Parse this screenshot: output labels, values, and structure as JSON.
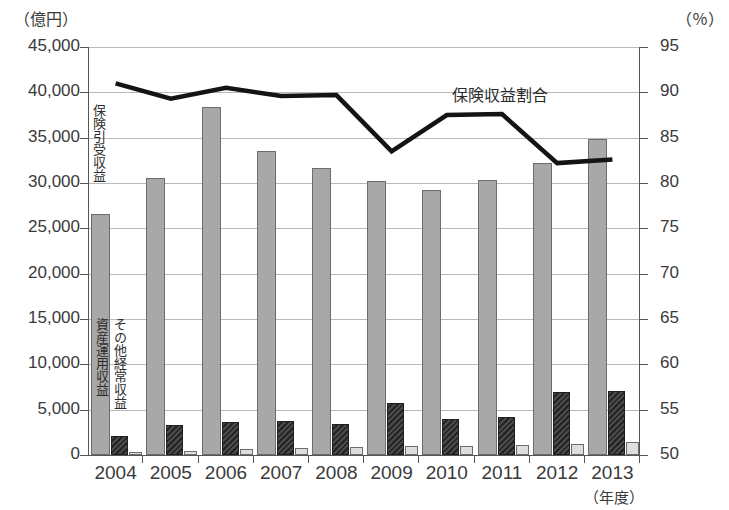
{
  "chart_data": {
    "type": "bar",
    "title": "",
    "xlabel": "年度",
    "ylabel": "億円",
    "y2label": "%",
    "ylim": [
      0,
      45000
    ],
    "y2lim": [
      50,
      95
    ],
    "grid": true,
    "legend_position": "inline-annotations",
    "categories": [
      "2004",
      "2005",
      "2006",
      "2007",
      "2008",
      "2009",
      "2010",
      "2011",
      "2012",
      "2013"
    ],
    "series": [
      {
        "name": "保険引受収益",
        "type": "bar",
        "axis": "left",
        "unit": "億円",
        "color": "#a8a8a8",
        "values": [
          26600,
          30600,
          38400,
          33500,
          31700,
          30200,
          29200,
          30300,
          32200,
          34800
        ]
      },
      {
        "name": "資産運用収益",
        "type": "bar",
        "axis": "left",
        "unit": "億円",
        "color": "#3a3a3a",
        "values": [
          2100,
          3300,
          3600,
          3750,
          3400,
          5700,
          4000,
          4200,
          6900,
          7100
        ]
      },
      {
        "name": "その他経常収益",
        "type": "bar",
        "axis": "left",
        "unit": "億円",
        "color": "#dedede",
        "values": [
          350,
          450,
          700,
          750,
          900,
          1000,
          1000,
          1100,
          1200,
          1450
        ]
      },
      {
        "name": "保険収益割合",
        "type": "line",
        "axis": "right",
        "unit": "%",
        "color": "#1a1a1a",
        "values": [
          91.0,
          89.3,
          90.5,
          89.6,
          89.7,
          83.5,
          87.5,
          87.6,
          82.2,
          82.6
        ]
      }
    ],
    "y_ticks": [
      "0",
      "5,000",
      "10,000",
      "15,000",
      "20,000",
      "25,000",
      "30,000",
      "35,000",
      "40,000",
      "45,000"
    ],
    "y2_ticks": [
      "50",
      "55",
      "60",
      "65",
      "70",
      "75",
      "80",
      "85",
      "90",
      "95"
    ]
  },
  "labels": {
    "unit_left": "（億円）",
    "unit_right": "（％）",
    "x_unit": "（年度）",
    "annotation_line": "保険収益割合",
    "annotation_bar_insurance": "保険引受収益",
    "annotation_bar_asset": "資産運用収益",
    "annotation_bar_other": "その他経常収益"
  }
}
